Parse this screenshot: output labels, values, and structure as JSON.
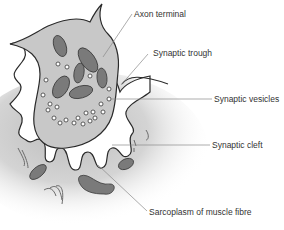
{
  "diagram": {
    "labels": {
      "axon_terminal": "Axon terminal",
      "synaptic_trough": "Synaptic trough",
      "synaptic_vesicles": "Synaptic vesicles",
      "synaptic_cleft": "Synaptic cleft",
      "sarcoplasm": "Sarcoplasm of muscle fibre"
    },
    "colors": {
      "axon_fill": "#c8c8c8",
      "organelle_fill": "#7a7a7a",
      "outline": "#2a2a2a",
      "sarcoplasm_gradient": "#bdbdbd",
      "leader_line": "#8a8a8a",
      "text": "#333333"
    }
  }
}
